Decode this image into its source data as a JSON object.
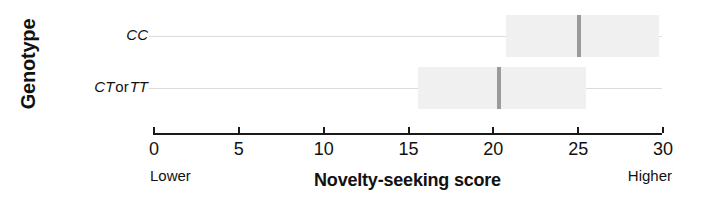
{
  "chart_data": {
    "type": "bar",
    "title": "",
    "xlabel": "Novelty-seeking score",
    "ylabel": "Genotype",
    "xlim": [
      0,
      30
    ],
    "xticks": [
      0,
      5,
      10,
      15,
      20,
      25,
      30
    ],
    "xtick_labels": [
      "0",
      "5",
      "10",
      "15",
      "20",
      "25",
      "30"
    ],
    "grid": false,
    "legend": "none",
    "axis_end_labels": {
      "low": "Lower",
      "high": "Higher"
    },
    "categories": [
      "CC",
      "CT or TT"
    ],
    "series": [
      {
        "name": "Novelty-seeking score",
        "points": [
          {
            "category": "CC",
            "value": 25.1,
            "ci_low": 20.8,
            "ci_high": 29.8
          },
          {
            "category": "CT or TT",
            "value": 20.4,
            "ci_low": 15.6,
            "ci_high": 25.5
          }
        ]
      }
    ]
  },
  "rows": [
    {
      "id": "cc",
      "label_parts": {
        "gene_a": "CC",
        "conj": "",
        "gene_b": ""
      },
      "label_plain": "CC"
    },
    {
      "id": "ctt",
      "label_parts": {
        "gene_a": "CT",
        "conj": "or",
        "gene_b": "TT"
      },
      "label_plain": "CT or TT"
    }
  ],
  "colors": {
    "band": "#f0f0f0",
    "marker": "#9a9a9a",
    "axis": "#1a1a1a",
    "guide": "#dcdcdc",
    "text": "#111111",
    "background": "#ffffff"
  }
}
